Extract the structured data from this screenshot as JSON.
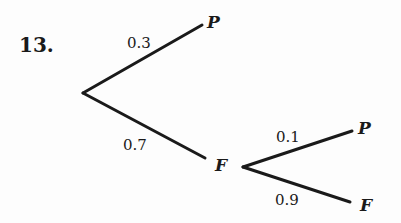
{
  "problem": {
    "number": "13."
  },
  "tree": {
    "nodes": {
      "top_leaf": "P",
      "mid": "F",
      "mid_top_leaf": "P",
      "mid_bottom_leaf": "F"
    },
    "edges": {
      "root_to_P": "0.3",
      "root_to_F": "0.7",
      "F_to_P": "0.1",
      "F_to_F": "0.9"
    }
  }
}
